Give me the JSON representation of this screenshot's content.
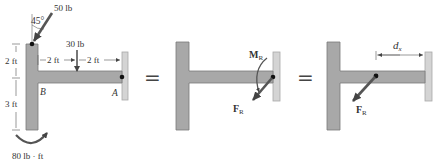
{
  "colors": {
    "member_fill": "#a8a8a8",
    "member_stroke": "#7a7a7a",
    "wall_fill": "#d4d4d4",
    "wall_stroke": "#a0a0a0",
    "arrow": "#555555",
    "text": "#333333"
  },
  "panel1": {
    "force_50": "50 lb",
    "angle": "45°",
    "force_30": "30 lb",
    "dim_2ft_left": "2 ft",
    "dim_2ft_a": "2 ft",
    "dim_2ft_b": "2 ft",
    "dim_3ft": "3 ft",
    "point_b": "B",
    "point_a": "A",
    "couple": "80 lb · ft"
  },
  "equals_1": "=",
  "panel2": {
    "moment_label": "M",
    "moment_sub": "R",
    "force_label": "F",
    "force_sub": "R"
  },
  "equals_2": "=",
  "panel3": {
    "dist_label": "d",
    "dist_sub": "x",
    "force_label": "F",
    "force_sub": "R"
  }
}
